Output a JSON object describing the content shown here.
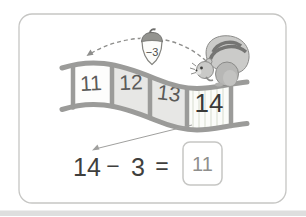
{
  "track": {
    "cells": [
      {
        "label": "11"
      },
      {
        "label": "12"
      },
      {
        "label": "13"
      },
      {
        "label": "14"
      }
    ]
  },
  "acorn": {
    "label": "−3"
  },
  "equation": {
    "minuend": "14",
    "operator": "−",
    "subtrahend": "3",
    "equals": "=",
    "answer": "11"
  },
  "colors": {
    "card_border": "#c6c6c4",
    "rail": "#9b9b99",
    "panel_shaded": "#e7e7e5",
    "panel_light": "#fdfdfc",
    "stripe": "#e9ece4",
    "arrow": "#8e8e8c",
    "answer_text": "#8f8f8d",
    "page_edge": "#dedede"
  }
}
